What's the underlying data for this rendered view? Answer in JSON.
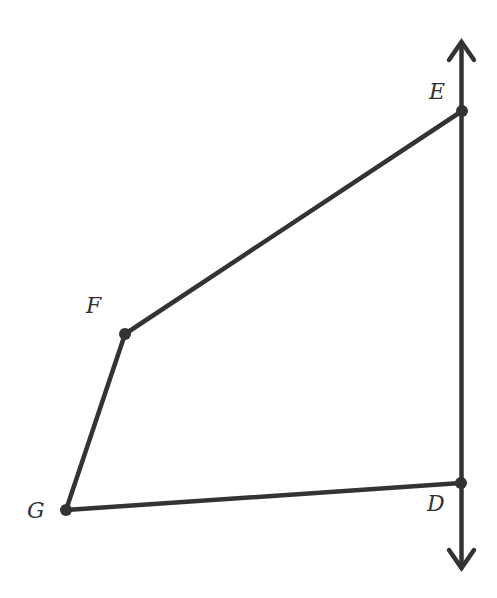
{
  "diagram": {
    "type": "geometry",
    "stroke_color": "#333333",
    "background_color": "#ffffff",
    "line": {
      "name": "line-DE",
      "through": [
        "E",
        "D"
      ],
      "arrows": "both"
    },
    "points": [
      {
        "id": "E",
        "label": "E"
      },
      {
        "id": "F",
        "label": "F"
      },
      {
        "id": "G",
        "label": "G"
      },
      {
        "id": "D",
        "label": "D"
      }
    ],
    "segments": [
      {
        "from": "E",
        "to": "F"
      },
      {
        "from": "F",
        "to": "G"
      },
      {
        "from": "G",
        "to": "D"
      }
    ]
  }
}
